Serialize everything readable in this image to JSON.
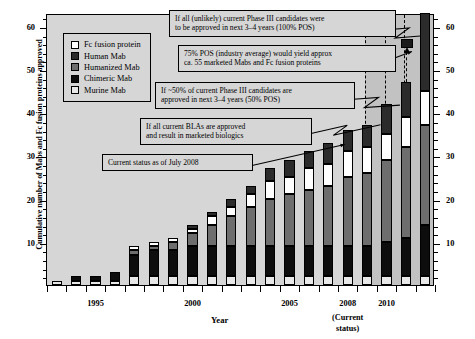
{
  "chart_data": {
    "type": "bar",
    "subtype": "stacked-bar-cumulative",
    "title": "",
    "xlabel": "Year",
    "ylabel": "Cumulative number of Mabs and Fc fusion proteins approved",
    "ylim": [
      0,
      63
    ],
    "ytick_major": [
      10,
      20,
      30,
      40,
      50,
      60
    ],
    "ytick_step_minor": 2,
    "grid": false,
    "legend_position": "upper-left inside plot",
    "xlabels_shown": [
      "1995",
      "2000",
      "2005",
      "2008",
      "2010"
    ],
    "categories": [
      "1993",
      "1994",
      "1995",
      "1996",
      "1997",
      "1998",
      "1999",
      "2000",
      "2001",
      "2002",
      "2003",
      "2004",
      "2005",
      "2006",
      "2007",
      "2008",
      "2009",
      "2010",
      "2011",
      "2012"
    ],
    "series": [
      {
        "name": "Murine Mab",
        "color": "#e8e8e8",
        "values": [
          1,
          1,
          1,
          1,
          2,
          2,
          2,
          2,
          2,
          2,
          2,
          2,
          2,
          2,
          2,
          2,
          2,
          2,
          2,
          2
        ]
      },
      {
        "name": "Chimeric Mab",
        "color": "#0d0d0d",
        "values": [
          0,
          1,
          1,
          2,
          5,
          6,
          6,
          7,
          7,
          7,
          7,
          7,
          7,
          7,
          7,
          7,
          7,
          8,
          9,
          12
        ]
      },
      {
        "name": "Humanized Mab",
        "color": "#6e6e6e",
        "values": [
          0,
          0,
          0,
          0,
          1,
          1,
          2,
          3,
          5,
          7,
          9,
          11,
          12,
          13,
          14,
          16,
          17,
          19,
          21,
          23
        ]
      },
      {
        "name": "Fc fusion protein",
        "color": "#ffffff",
        "values": [
          0,
          0,
          0,
          0,
          1,
          1,
          1,
          1,
          2,
          2,
          3,
          4,
          4,
          5,
          5,
          6,
          6,
          6,
          7,
          8
        ]
      },
      {
        "name": "Human Mab",
        "color": "#2b2b2b",
        "values": [
          0,
          0,
          0,
          0,
          0,
          0,
          0,
          1,
          1,
          2,
          2,
          3,
          4,
          4,
          5,
          5,
          5,
          7,
          8,
          18
        ]
      }
    ],
    "totals": [
      1,
      2,
      2,
      3,
      9,
      10,
      11,
      14,
      17,
      20,
      23,
      27,
      29,
      31,
      33,
      36,
      37,
      42,
      47,
      63
    ],
    "annotations": [
      {
        "text": "If all (unlikely) current Phase III candidates were to be approved in next 3–4 years (100% POS)",
        "points_to": "2012"
      },
      {
        "text": "75% POS (industry average) would yield approx ca. 55 marketed Mabs and Fc fusion proteins",
        "points_to": "2012-marker-55"
      },
      {
        "text": "If ~50% of current Phase III candidates are approved in next 3–4 years (50% POS)",
        "points_to": "2011"
      },
      {
        "text": "If all current BLAs are approved and result in marketed biologics",
        "points_to": "2010"
      },
      {
        "text": "Current status as of July 2008",
        "points_to": "2008"
      }
    ],
    "forecast_region_start": "2009"
  },
  "axes": {
    "y_title": "Cumulative number of Mabs and Fc fusion proteins approved",
    "x_title": "Year",
    "current_status_note_line1": "(Current",
    "current_status_note_line2": "status)",
    "y_labels": [
      "10",
      "20",
      "30",
      "40",
      "50",
      "60"
    ],
    "x_labels": [
      "1995",
      "2000",
      "2005",
      "2008",
      "2010"
    ]
  },
  "legend": {
    "items": [
      {
        "label": "Fc fusion protein",
        "color": "#ffffff"
      },
      {
        "label": "Human Mab",
        "color": "#2b2b2b"
      },
      {
        "label": "Humanized Mab",
        "color": "#6e6e6e"
      },
      {
        "label": "Chimeric Mab",
        "color": "#0d0d0d"
      },
      {
        "label": "Murine Mab",
        "color": "#e8e8e8"
      }
    ]
  },
  "callouts": {
    "c1_line1": "If all (unlikely) current Phase III candidates were",
    "c1_line2": "to be approved in next 3–4 years (100% POS)",
    "c2_line1": "75% POS (industry average) would yield approx",
    "c2_line2": "ca. 55 marketed Mabs and Fc fusion proteins",
    "c3_line1": "If ~50% of current Phase III candidates are",
    "c3_line2": "approved in next 3–4 years (50% POS)",
    "c4_line1": "If all current BLAs are approved",
    "c4_line2": "and result in marketed biologics",
    "c5_line1": "Current status as of July 2008"
  },
  "colors": {
    "plot_bg": "#d6d6d6",
    "forecast_bg": "#c2c2c2",
    "page_bg": "#ffffff",
    "axis": "#000000"
  }
}
